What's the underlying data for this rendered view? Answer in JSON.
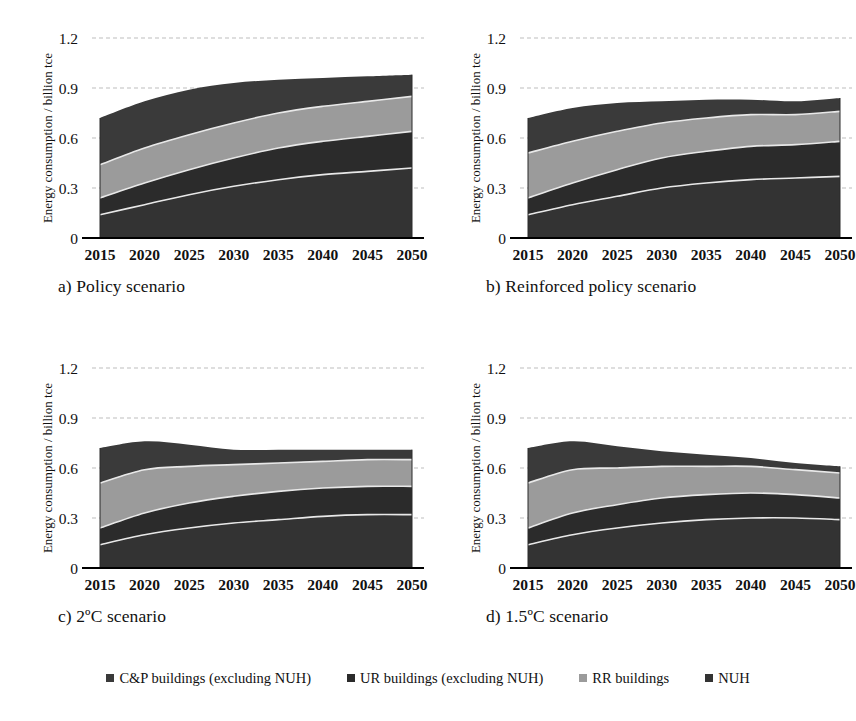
{
  "figure": {
    "panels": [
      {
        "id": "a",
        "caption_prefix": "a)",
        "caption": "a) Policy scenario",
        "title": "Policy scenario"
      },
      {
        "id": "b",
        "caption_prefix": "b)",
        "caption": "b) Reinforced policy scenario",
        "title": "Reinforced policy scenario"
      },
      {
        "id": "c",
        "caption_prefix": "c)",
        "caption": "c) 2ºC scenario",
        "title": "2ºC scenario"
      },
      {
        "id": "d",
        "caption_prefix": "d)",
        "caption": "d) 1.5ºC scenario",
        "title": "1.5ºC scenario"
      }
    ]
  },
  "legend": {
    "position": "bottom",
    "items": [
      {
        "label": "C&P buildings (excluding NUH)",
        "color": "#3a3a3a"
      },
      {
        "label": "UR buildings (excluding NUH)",
        "color": "#2b2b2b"
      },
      {
        "label": "RR buildings",
        "color": "#9b9b9b"
      },
      {
        "label": "NUH",
        "color": "#333333"
      }
    ]
  },
  "colors": {
    "cp": "#3a3a3a",
    "ur": "#2b2b2b",
    "rr": "#9b9b9b",
    "nuh": "#333333",
    "gridline": "#bdbdbd",
    "axis": "#000000",
    "band_edge": "#e8e8e8"
  },
  "chart_data": [
    {
      "type": "area",
      "panel": "a",
      "title": "a) Policy scenario",
      "xlabel": "",
      "ylabel": "Energy consumption / billion tce",
      "x": [
        2015,
        2020,
        2025,
        2030,
        2035,
        2040,
        2045,
        2050
      ],
      "xticks": [
        "2015",
        "2020",
        "2025",
        "2030",
        "2035",
        "2040",
        "2045",
        "2050"
      ],
      "yticks": [
        "0",
        "0.3",
        "0.6",
        "0.9",
        "1.2"
      ],
      "ylim": [
        0,
        1.2
      ],
      "grid": true,
      "stacked": true,
      "series": [
        {
          "name": "NUH",
          "color": "#333333",
          "values": [
            0.14,
            0.2,
            0.26,
            0.31,
            0.35,
            0.38,
            0.4,
            0.42
          ]
        },
        {
          "name": "UR buildings (excluding NUH)",
          "color": "#2b2b2b",
          "values": [
            0.1,
            0.13,
            0.15,
            0.17,
            0.19,
            0.2,
            0.21,
            0.22
          ]
        },
        {
          "name": "RR buildings",
          "color": "#9b9b9b",
          "values": [
            0.2,
            0.21,
            0.21,
            0.21,
            0.21,
            0.21,
            0.21,
            0.21
          ]
        },
        {
          "name": "C&P buildings (excluding NUH)",
          "color": "#3a3a3a",
          "values": [
            0.28,
            0.28,
            0.27,
            0.24,
            0.2,
            0.17,
            0.15,
            0.13
          ]
        }
      ],
      "totals": [
        0.72,
        0.82,
        0.89,
        0.93,
        0.95,
        0.96,
        0.97,
        0.98
      ]
    },
    {
      "type": "area",
      "panel": "b",
      "title": "b) Reinforced policy scenario",
      "xlabel": "",
      "ylabel": "Energy consumption / billion tce",
      "x": [
        2015,
        2020,
        2025,
        2030,
        2035,
        2040,
        2045,
        2050
      ],
      "xticks": [
        "2015",
        "2020",
        "2025",
        "2030",
        "2035",
        "2040",
        "2045",
        "2050"
      ],
      "yticks": [
        "0",
        "0.3",
        "0.6",
        "0.9",
        "1.2"
      ],
      "ylim": [
        0,
        1.2
      ],
      "grid": true,
      "stacked": true,
      "series": [
        {
          "name": "NUH",
          "color": "#333333",
          "values": [
            0.14,
            0.2,
            0.25,
            0.3,
            0.33,
            0.35,
            0.36,
            0.37
          ]
        },
        {
          "name": "UR buildings (excluding NUH)",
          "color": "#2b2b2b",
          "values": [
            0.1,
            0.13,
            0.16,
            0.18,
            0.19,
            0.2,
            0.2,
            0.21
          ]
        },
        {
          "name": "RR buildings",
          "color": "#9b9b9b",
          "values": [
            0.27,
            0.25,
            0.23,
            0.21,
            0.2,
            0.19,
            0.18,
            0.18
          ]
        },
        {
          "name": "C&P buildings (excluding NUH)",
          "color": "#3a3a3a",
          "values": [
            0.21,
            0.2,
            0.17,
            0.13,
            0.11,
            0.09,
            0.08,
            0.08
          ]
        }
      ],
      "totals": [
        0.72,
        0.78,
        0.81,
        0.82,
        0.83,
        0.83,
        0.82,
        0.84
      ]
    },
    {
      "type": "area",
      "panel": "c",
      "title": "c) 2ºC scenario",
      "xlabel": "",
      "ylabel": "Energy consumption / billion tce",
      "x": [
        2015,
        2020,
        2025,
        2030,
        2035,
        2040,
        2045,
        2050
      ],
      "xticks": [
        "2015",
        "2020",
        "2025",
        "2030",
        "2035",
        "2040",
        "2045",
        "2050"
      ],
      "yticks": [
        "0",
        "0.3",
        "0.6",
        "0.9",
        "1.2"
      ],
      "ylim": [
        0,
        1.2
      ],
      "grid": true,
      "stacked": true,
      "series": [
        {
          "name": "NUH",
          "color": "#333333",
          "values": [
            0.14,
            0.2,
            0.24,
            0.27,
            0.29,
            0.31,
            0.32,
            0.32
          ]
        },
        {
          "name": "UR buildings (excluding NUH)",
          "color": "#2b2b2b",
          "values": [
            0.1,
            0.13,
            0.15,
            0.16,
            0.17,
            0.17,
            0.17,
            0.17
          ]
        },
        {
          "name": "RR buildings",
          "color": "#9b9b9b",
          "values": [
            0.27,
            0.26,
            0.22,
            0.19,
            0.17,
            0.16,
            0.16,
            0.16
          ]
        },
        {
          "name": "C&P buildings (excluding NUH)",
          "color": "#3a3a3a",
          "values": [
            0.21,
            0.17,
            0.13,
            0.09,
            0.08,
            0.07,
            0.06,
            0.06
          ]
        }
      ],
      "totals": [
        0.72,
        0.76,
        0.74,
        0.71,
        0.71,
        0.71,
        0.71,
        0.71
      ]
    },
    {
      "type": "area",
      "panel": "d",
      "title": "d) 1.5ºC scenario",
      "xlabel": "",
      "ylabel": "Energy consumption / billion tce",
      "x": [
        2015,
        2020,
        2025,
        2030,
        2035,
        2040,
        2045,
        2050
      ],
      "xticks": [
        "2015",
        "2020",
        "2025",
        "2030",
        "2035",
        "2040",
        "2045",
        "2050"
      ],
      "yticks": [
        "0",
        "0.3",
        "0.6",
        "0.9",
        "1.2"
      ],
      "ylim": [
        0,
        1.2
      ],
      "grid": true,
      "stacked": true,
      "series": [
        {
          "name": "NUH",
          "color": "#333333",
          "values": [
            0.14,
            0.2,
            0.24,
            0.27,
            0.29,
            0.3,
            0.3,
            0.29
          ]
        },
        {
          "name": "UR buildings (excluding NUH)",
          "color": "#2b2b2b",
          "values": [
            0.1,
            0.13,
            0.14,
            0.15,
            0.15,
            0.15,
            0.14,
            0.13
          ]
        },
        {
          "name": "RR buildings",
          "color": "#9b9b9b",
          "values": [
            0.27,
            0.26,
            0.22,
            0.19,
            0.17,
            0.16,
            0.15,
            0.15
          ]
        },
        {
          "name": "C&P buildings (excluding NUH)",
          "color": "#3a3a3a",
          "values": [
            0.21,
            0.17,
            0.13,
            0.09,
            0.07,
            0.05,
            0.04,
            0.04
          ]
        }
      ],
      "totals": [
        0.72,
        0.76,
        0.73,
        0.7,
        0.68,
        0.66,
        0.63,
        0.61
      ]
    }
  ]
}
